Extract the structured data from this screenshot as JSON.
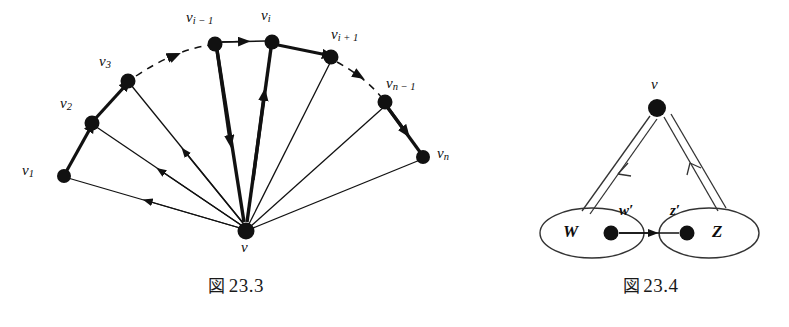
{
  "page": {
    "background": "#ffffff",
    "ink": "#111111",
    "width": 789,
    "height": 327
  },
  "figures": [
    {
      "id": "fig-23-3",
      "caption_kanji": "図",
      "caption_number": "23.3",
      "description": "Fan of vertices v1..vn on an arc with a center vertex v; bold path along the arc and spokes to v",
      "center_vertex": {
        "label": "v",
        "x": 246,
        "y": 231,
        "r": 8
      },
      "arc_vertices": [
        {
          "name": "v1",
          "label_text": "v",
          "label_sub": "1",
          "x": 64,
          "y": 176,
          "lx": 22,
          "ly": 168
        },
        {
          "name": "v2",
          "label_text": "v",
          "label_sub": "2",
          "x": 92,
          "y": 123,
          "lx": 60,
          "ly": 100
        },
        {
          "name": "v3",
          "label_text": "v",
          "label_sub": "3",
          "x": 128,
          "y": 81,
          "lx": 100,
          "ly": 58
        },
        {
          "name": "vi-1",
          "label_text": "v",
          "label_sub": "i − 1",
          "x": 215,
          "y": 44,
          "lx": 186,
          "ly": 14
        },
        {
          "name": "vi",
          "label_text": "v",
          "label_sub": "i",
          "x": 272,
          "y": 42,
          "lx": 262,
          "ly": 12
        },
        {
          "name": "vi+1",
          "label_text": "v",
          "label_sub": "i + 1",
          "x": 331,
          "y": 57,
          "lx": 330,
          "ly": 30
        },
        {
          "name": "vn-1",
          "label_text": "v",
          "label_sub": "n − 1",
          "x": 385,
          "y": 102,
          "lx": 385,
          "ly": 79
        },
        {
          "name": "vn",
          "label_text": "v",
          "label_sub": "n",
          "x": 423,
          "y": 157,
          "lx": 437,
          "ly": 148
        }
      ],
      "arc_edges": [
        {
          "from": "v1",
          "to": "v2",
          "style": "bold"
        },
        {
          "from": "v2",
          "to": "v3",
          "style": "bold"
        },
        {
          "from": "v3",
          "to": "vi-1",
          "style": "dashed"
        },
        {
          "from": "vi-1",
          "to": "vi",
          "style": "thin"
        },
        {
          "from": "vi",
          "to": "vi+1",
          "style": "bold"
        },
        {
          "from": "vi+1",
          "to": "vn-1",
          "style": "dashed"
        },
        {
          "from": "vn-1",
          "to": "vn",
          "style": "bold"
        }
      ],
      "spokes": [
        {
          "vertex": "v1",
          "direction": "from-v",
          "style": "thin"
        },
        {
          "vertex": "v2",
          "direction": "from-v",
          "style": "thin"
        },
        {
          "vertex": "v3",
          "direction": "from-v",
          "style": "thin"
        },
        {
          "vertex": "vi-1",
          "direction": "from-v",
          "style": "bold"
        },
        {
          "vertex": "vi",
          "direction": "to-v",
          "style": "bold"
        },
        {
          "vertex": "vi+1",
          "direction": "to-v",
          "style": "thin"
        },
        {
          "vertex": "vn-1",
          "direction": "to-v",
          "style": "thin"
        },
        {
          "vertex": "vn",
          "direction": "to-v",
          "style": "thin"
        }
      ]
    },
    {
      "id": "fig-23-4",
      "caption_kanji": "図",
      "caption_number": "23.4",
      "description": "Vertex v with double-line edges to set W and from set Z; inner vertices w-prime and z-prime joined by an arrow",
      "top_vertex": {
        "label": "v",
        "x": 157,
        "y": 108,
        "r": 9,
        "lx": 151,
        "ly": 80
      },
      "sets": [
        {
          "name": "W",
          "label": "W",
          "cx": 92,
          "cy": 233,
          "rx": 52,
          "ry": 25,
          "label_x": 69,
          "label_y": 224
        },
        {
          "name": "Z",
          "label": "Z",
          "cx": 209,
          "cy": 233,
          "rx": 50,
          "ry": 25,
          "label_x": 216,
          "label_y": 224
        }
      ],
      "inner_vertices": [
        {
          "name": "w-prime",
          "label": "w′",
          "x": 111,
          "y": 233,
          "r": 7,
          "lx": 103,
          "ly": 202
        },
        {
          "name": "z-prime",
          "label": "z′",
          "x": 187,
          "y": 233,
          "r": 7,
          "lx": 164,
          "ly": 202
        }
      ],
      "edges": [
        {
          "from": "v",
          "to": "W",
          "style": "double-line",
          "arrow": "toward-W"
        },
        {
          "from": "Z",
          "to": "v",
          "style": "double-line",
          "arrow": "toward-v"
        },
        {
          "from": "w-prime",
          "to": "z-prime",
          "style": "thin",
          "arrow": "toward-z-prime"
        }
      ]
    }
  ]
}
